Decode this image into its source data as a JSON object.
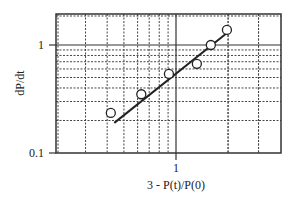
{
  "chart_data": {
    "type": "scatter",
    "title": "",
    "xlabel": "3 - P(t)/P(0)",
    "ylabel": "dP/dt",
    "xscale": "log",
    "yscale": "log",
    "xlim": [
      0.2,
      4.0
    ],
    "ylim": [
      0.1,
      1.8
    ],
    "x_tick_labels": [
      "1"
    ],
    "y_tick_labels": [
      "1",
      "0.1"
    ],
    "grid": true,
    "legend": null,
    "series": [
      {
        "name": "data",
        "marker": "open-circle",
        "x": [
          0.42,
          0.63,
          0.91,
          1.32,
          1.59,
          1.97
        ],
        "y": [
          0.235,
          0.35,
          0.54,
          0.67,
          1.0,
          1.38
        ]
      },
      {
        "name": "fit",
        "style": "line",
        "x": [
          0.44,
          1.97
        ],
        "y": [
          0.19,
          1.29
        ]
      }
    ]
  },
  "labels": {
    "xlabel": "3 - P(t)/P(0)",
    "ylabel": "dP/dt",
    "ytick_1": "1",
    "ytick_01": "0.1",
    "xtick_1": "1"
  }
}
